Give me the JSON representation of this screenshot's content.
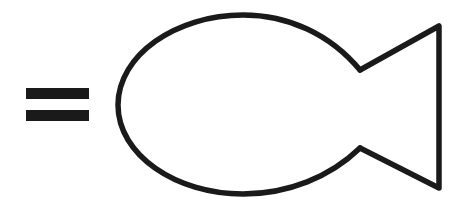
{
  "canvas": {
    "width": 462,
    "height": 202,
    "background_color": "#ffffff",
    "ink_color": "#1a1a1a"
  },
  "figure": {
    "stroke_color": "#1a1a1a",
    "stroke_width": 5.5,
    "fill": "none"
  },
  "equals_sign": {
    "name": "equals-sign",
    "glyph": "=",
    "color": "#1a1a1a",
    "bars": [
      {
        "label": "upper-bar",
        "x": 26,
        "y": 88,
        "width": 63,
        "height": 11
      },
      {
        "label": "lower-bar",
        "x": 26,
        "y": 110,
        "width": 63,
        "height": 11
      }
    ]
  },
  "fish": {
    "name": "fish-outline",
    "body": {
      "label": "fish-body",
      "shape": "egg-ellipse",
      "left_tip_x": 118,
      "top_y": 15,
      "bottom_y": 194,
      "center_y": 105,
      "path": "M 360 70 C 330 34, 288 15, 243 15 C 176 15, 118 55, 118 105 C 118 155, 176 194, 243 194 C 288 194, 330 177, 360 148"
    },
    "tail": {
      "label": "fish-tail",
      "shape": "notched-triangle",
      "upper_notch": {
        "x": 360,
        "y": 70
      },
      "lower_notch": {
        "x": 360,
        "y": 148
      },
      "upper_tip": {
        "x": 439,
        "y": 26
      },
      "lower_tip": {
        "x": 439,
        "y": 188
      },
      "path": "M 360 70 L 439 26 L 439 188 L 360 148"
    }
  }
}
